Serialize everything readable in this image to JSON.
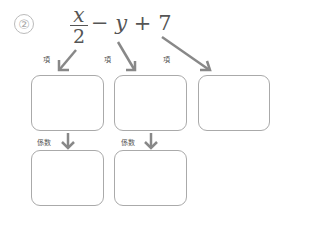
{
  "problem": {
    "number": "②",
    "expression": {
      "fraction": {
        "numerator": "x",
        "denominator": "2"
      },
      "rest": [
        {
          "text": "−",
          "kind": "op"
        },
        {
          "text": "y",
          "kind": "var"
        },
        {
          "text": "+",
          "kind": "op"
        },
        {
          "text": "7",
          "kind": "num"
        }
      ]
    }
  },
  "labels": {
    "term": "項",
    "coefficient": "係数"
  },
  "colors": {
    "arrow": "#888888",
    "box_border": "#aaaaaa",
    "text": "#555555"
  }
}
